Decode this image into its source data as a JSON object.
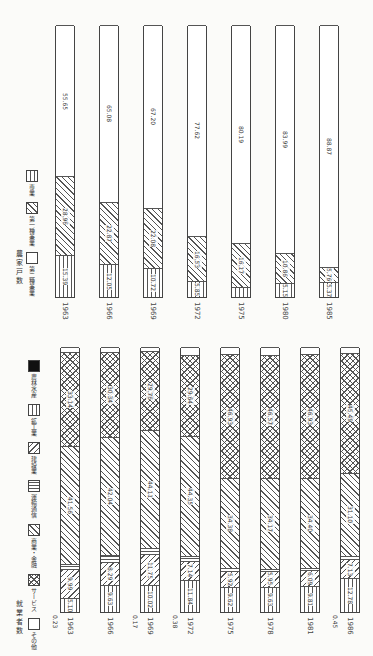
{
  "chart_data": [
    {
      "type": "bar",
      "stacked": true,
      "orientation": "rotated-page",
      "title": "農家戸数",
      "categories": [
        "1963",
        "1966",
        "1969",
        "1972",
        "1975",
        "1980",
        "1985"
      ],
      "series": [
        {
          "name": "専業",
          "pattern": "vlines",
          "values": [
            15.39,
            12.05,
            10.72,
            5.85,
            3.64,
            5.15,
            5.37
          ]
        },
        {
          "name": "第一種兼業",
          "pattern": "diag",
          "values": [
            28.96,
            22.87,
            22.08,
            16.53,
            16.17,
            10.86,
            5.76
          ]
        },
        {
          "name": "第二種兼業",
          "pattern": "white",
          "values": [
            55.65,
            65.08,
            67.2,
            77.62,
            80.19,
            83.99,
            88.87
          ]
        }
      ],
      "unit": "%",
      "ylim": [
        0,
        100
      ]
    },
    {
      "type": "bar",
      "stacked": true,
      "orientation": "rotated-page",
      "title": "就業者数",
      "categories": [
        "1963",
        "1966",
        "1969",
        "1972",
        "1975",
        "1978",
        "1981",
        "1986"
      ],
      "series": [
        {
          "name": "農林水産",
          "pattern": "dark",
          "values": [
            0.23,
            0,
            0.17,
            0.38,
            0,
            0,
            0,
            0.45
          ]
        },
        {
          "name": "鉱工業",
          "pattern": "vlines",
          "values": [
            5.1,
            9.63,
            10.02,
            11.84,
            9.62,
            9.63,
            9.81,
            12.78
          ]
        },
        {
          "name": "建設業",
          "pattern": "diag2",
          "values": [
            9.99,
            8.29,
            11.75,
            7.14,
            5.92,
            5.95,
            6.09,
            7.13
          ]
        },
        {
          "name": "運輸通信",
          "pattern": "hlines",
          "values": [
            2.06,
            2.63,
            2.17,
            1.84,
            1.13,
            0.84,
            0.93,
            1.34
          ]
        },
        {
          "name": "商業・金融",
          "pattern": "diag",
          "values": [
            41.56,
            42.04,
            44.11,
            44.35,
            34.38,
            34.17,
            34.4,
            31.1
          ]
        },
        {
          "name": "サービス",
          "pattern": "cross",
          "values": [
            33.14,
            30.34,
            29.76,
            29.64,
            46.93,
            46.57,
            46.93,
            45.49
          ]
        },
        {
          "name": "その他",
          "pattern": "white",
          "values": [
            1.92,
            1.8,
            1.5,
            3.07,
            2.75,
            3.01,
            2.83,
            2.23
          ]
        }
      ],
      "unit": "%",
      "ylim": [
        0,
        100
      ]
    }
  ],
  "top_chart": {
    "title": "農家戸数",
    "legend": [
      {
        "label": "専業",
        "pattern": "vlines"
      },
      {
        "label": "第一種兼業",
        "pattern": "diag"
      },
      {
        "label": "第二種兼業",
        "pattern": "white"
      }
    ],
    "bars": [
      {
        "year": "1963",
        "segs": [
          {
            "v": 15.39,
            "t": "15.39",
            "p": "vlines"
          },
          {
            "v": 28.96,
            "t": "28.96",
            "p": "diag"
          },
          {
            "v": 55.65,
            "t": "55.65",
            "p": "white"
          }
        ]
      },
      {
        "year": "1966",
        "segs": [
          {
            "v": 12.05,
            "t": "12.05",
            "p": "vlines"
          },
          {
            "v": 22.87,
            "t": "22.87",
            "p": "diag"
          },
          {
            "v": 65.08,
            "t": "65.08",
            "p": "white"
          }
        ]
      },
      {
        "year": "1969",
        "segs": [
          {
            "v": 10.72,
            "t": "10.72",
            "p": "vlines"
          },
          {
            "v": 22.08,
            "t": "22.08",
            "p": "diag"
          },
          {
            "v": 67.2,
            "t": "67.20",
            "p": "white"
          }
        ]
      },
      {
        "year": "1972",
        "segs": [
          {
            "v": 5.85,
            "t": "5.85",
            "p": "vlines"
          },
          {
            "v": 16.53,
            "t": "16.53",
            "p": "diag"
          },
          {
            "v": 77.62,
            "t": "77.62",
            "p": "white"
          }
        ]
      },
      {
        "year": "1975",
        "segs": [
          {
            "v": 3.64,
            "t": "3.64",
            "p": "vlines"
          },
          {
            "v": 16.17,
            "t": "16.17",
            "p": "diag"
          },
          {
            "v": 80.19,
            "t": "80.19",
            "p": "white"
          }
        ]
      },
      {
        "year": "1980",
        "segs": [
          {
            "v": 5.15,
            "t": "5.15",
            "p": "vlines"
          },
          {
            "v": 10.86,
            "t": "10.86",
            "p": "diag"
          },
          {
            "v": 83.99,
            "t": "83.99",
            "p": "white"
          }
        ]
      },
      {
        "year": "1985",
        "segs": [
          {
            "v": 5.37,
            "t": "5.37",
            "p": "vlines"
          },
          {
            "v": 5.76,
            "t": "5.76",
            "p": "diag"
          },
          {
            "v": 88.87,
            "t": "88.87",
            "p": "white"
          }
        ]
      }
    ]
  },
  "bottom_chart": {
    "title": "就業者数",
    "legend": [
      {
        "label": "農林水産",
        "pattern": "dark"
      },
      {
        "label": "鉱工業",
        "pattern": "vlines"
      },
      {
        "label": "建設業",
        "pattern": "diag2"
      },
      {
        "label": "運輸通信",
        "pattern": "hlines"
      },
      {
        "label": "商業・金融",
        "pattern": "diag"
      },
      {
        "label": "サービス",
        "pattern": "cross"
      },
      {
        "label": "その他",
        "pattern": "white"
      }
    ],
    "bars": [
      {
        "year": "1963",
        "low": "0.23",
        "segs": [
          {
            "v": 5.1,
            "t": "5.10",
            "p": "vlines"
          },
          {
            "v": 9.99,
            "t": "9.99",
            "p": "diag2"
          },
          {
            "v": 2.06,
            "t": "2.06",
            "p": "hlines"
          },
          {
            "v": 41.56,
            "t": "41.56",
            "p": "diag"
          },
          {
            "v": 33.14,
            "t": "33.14",
            "p": "cross"
          },
          {
            "v": 1.92,
            "t": "1.92",
            "p": "white"
          }
        ]
      },
      {
        "year": "1966",
        "low": "",
        "segs": [
          {
            "v": 9.63,
            "t": "9.63",
            "p": "vlines"
          },
          {
            "v": 8.29,
            "t": "8.29",
            "p": "diag2"
          },
          {
            "v": 2.63,
            "t": "2.63",
            "p": "hlines"
          },
          {
            "v": 42.04,
            "t": "42.04",
            "p": "diag"
          },
          {
            "v": 30.34,
            "t": "30.34",
            "p": "cross"
          },
          {
            "v": 1.8,
            "t": "1.80",
            "p": "white"
          }
        ]
      },
      {
        "year": "1969",
        "low": "0.17",
        "segs": [
          {
            "v": 10.02,
            "t": "10.02",
            "p": "vlines"
          },
          {
            "v": 11.75,
            "t": "11.75",
            "p": "diag2"
          },
          {
            "v": 2.17,
            "t": "2.17",
            "p": "hlines"
          },
          {
            "v": 44.11,
            "t": "44.11",
            "p": "diag"
          },
          {
            "v": 29.76,
            "t": "29.76",
            "p": "cross"
          },
          {
            "v": 1.5,
            "t": "1.50",
            "p": "white"
          }
        ]
      },
      {
        "year": "1972",
        "low": "0.38",
        "segs": [
          {
            "v": 11.84,
            "t": "11.84",
            "p": "vlines"
          },
          {
            "v": 7.14,
            "t": "7.14",
            "p": "diag2"
          },
          {
            "v": 1.84,
            "t": "1.84",
            "p": "hlines"
          },
          {
            "v": 44.35,
            "t": "44.35",
            "p": "diag"
          },
          {
            "v": 29.64,
            "t": "29.64",
            "p": "cross"
          },
          {
            "v": 3.07,
            "t": "3.07",
            "p": "white"
          }
        ]
      },
      {
        "year": "1975",
        "low": "",
        "segs": [
          {
            "v": 9.62,
            "t": "9.62",
            "p": "vlines"
          },
          {
            "v": 5.92,
            "t": "5.92",
            "p": "diag2"
          },
          {
            "v": 1.13,
            "t": "1.13",
            "p": "hlines"
          },
          {
            "v": 34.38,
            "t": "34.38",
            "p": "diag"
          },
          {
            "v": 46.93,
            "t": "46.93",
            "p": "cross"
          },
          {
            "v": 2.75,
            "t": "2.75",
            "p": "white"
          }
        ]
      },
      {
        "year": "1978",
        "low": "",
        "segs": [
          {
            "v": 9.63,
            "t": "9.63",
            "p": "vlines"
          },
          {
            "v": 5.95,
            "t": "5.95",
            "p": "diag2"
          },
          {
            "v": 0.84,
            "t": "0.84",
            "p": "hlines"
          },
          {
            "v": 34.17,
            "t": "34.17",
            "p": "diag"
          },
          {
            "v": 46.57,
            "t": "46.57",
            "p": "cross"
          },
          {
            "v": 3.01,
            "t": "3.01",
            "p": "white"
          }
        ]
      },
      {
        "year": "1981",
        "low": "",
        "segs": [
          {
            "v": 9.81,
            "t": "9.81",
            "p": "vlines"
          },
          {
            "v": 6.09,
            "t": "6.09",
            "p": "diag2"
          },
          {
            "v": 0.93,
            "t": "0.93",
            "p": "hlines"
          },
          {
            "v": 34.4,
            "t": "34.40",
            "p": "diag"
          },
          {
            "v": 46.93,
            "t": "46.93",
            "p": "cross"
          },
          {
            "v": 2.83,
            "t": "2.83",
            "p": "white"
          }
        ]
      },
      {
        "year": "1986",
        "low": "0.45",
        "segs": [
          {
            "v": 12.78,
            "t": "12.78",
            "p": "vlines"
          },
          {
            "v": 7.13,
            "t": "7.13",
            "p": "diag2"
          },
          {
            "v": 1.34,
            "t": "1.34",
            "p": "hlines"
          },
          {
            "v": 31.1,
            "t": "31.10",
            "p": "diag"
          },
          {
            "v": 45.49,
            "t": "45.49",
            "p": "cross"
          },
          {
            "v": 2.23,
            "t": "2.23",
            "p": "white"
          }
        ]
      }
    ]
  }
}
